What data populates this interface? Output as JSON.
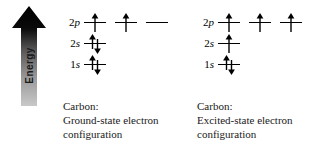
{
  "figure": {
    "energy_axis": {
      "label": "Energy",
      "direction": "up",
      "gradient_top_color": "#000000",
      "gradient_bottom_color": "#c8c8c8"
    },
    "diagrams": [
      {
        "id": "ground",
        "caption_line1": "Carbon:",
        "caption_line2": "Ground-state electron",
        "caption_line3": "configuration",
        "rows": [
          {
            "label_n": "2",
            "label_l": "p",
            "slots": [
              "up",
              "up",
              "empty"
            ]
          },
          {
            "label_n": "2",
            "label_l": "s",
            "slots": [
              "updown"
            ]
          },
          {
            "label_n": "1",
            "label_l": "s",
            "slots": [
              "updown"
            ]
          }
        ]
      },
      {
        "id": "excited",
        "caption_line1": "Carbon:",
        "caption_line2": "Excited-state electron",
        "caption_line3": "configuration",
        "rows": [
          {
            "label_n": "2",
            "label_l": "p",
            "slots": [
              "up",
              "up",
              "up"
            ]
          },
          {
            "label_n": "2",
            "label_l": "s",
            "slots": [
              "up"
            ]
          },
          {
            "label_n": "1",
            "label_l": "s",
            "slots": [
              "updown"
            ]
          }
        ]
      }
    ]
  }
}
